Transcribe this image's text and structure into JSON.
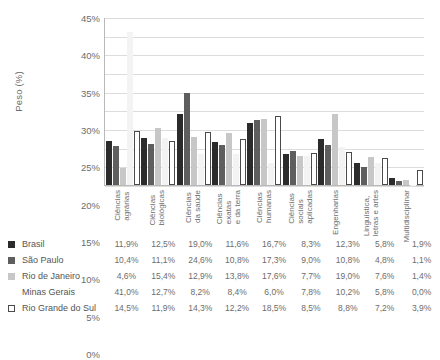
{
  "title_sliver": "",
  "axis": {
    "ylabel": "Peso (%)",
    "yticks": [
      "45%",
      "40%",
      "35%",
      "30%",
      "25%",
      "20%",
      "15%",
      "10%",
      "5%",
      "0%"
    ]
  },
  "colors": {
    "brasil": "#2b2b2b",
    "sao_paulo": "#5e5e5e",
    "rio_de_janeiro": "#c7c7c7",
    "minas_gerais": "#f3f3f3",
    "rio_grande_do_sul": "#ffffff",
    "grid": "#dcdcdc",
    "axis": "#b9b9b9"
  },
  "legend": [
    {
      "label": "Brasil",
      "swatch": "filled-dark-square"
    },
    {
      "label": "São Paulo",
      "swatch": "filled-mid-square"
    },
    {
      "label": "Rio de Janeiro",
      "swatch": "filled-light-square"
    },
    {
      "label": "Minas Gerais",
      "swatch": "no-swatch"
    },
    {
      "label": "Rio Grande do Sul",
      "swatch": "outlined-square"
    }
  ],
  "table": {
    "rows": [
      {
        "name": "Brasil",
        "values": [
          "11,9%",
          "12,5%",
          "19,0%",
          "11,6%",
          "16,7%",
          "8,3%",
          "12,3%",
          "5,8%",
          "1,9%"
        ]
      },
      {
        "name": "São Paulo",
        "values": [
          "10,4%",
          "11,1%",
          "24,6%",
          "10,8%",
          "17,3%",
          "9,0%",
          "10,8%",
          "4,8%",
          "1,1%"
        ]
      },
      {
        "name": "Rio de Janeiro",
        "values": [
          "4,6%",
          "15,4%",
          "12,9%",
          "13,8%",
          "17,6%",
          "7,7%",
          "19,0%",
          "7,6%",
          "1,4%"
        ]
      },
      {
        "name": "Minas Gerais",
        "values": [
          "41,0%",
          "12,7%",
          "8,2%",
          "8,4%",
          "6,0%",
          "7,8%",
          "10,2%",
          "5,8%",
          "0,0%"
        ]
      },
      {
        "name": "Rio Grande do Sul",
        "values": [
          "14,5%",
          "11,9%",
          "14,3%",
          "12,2%",
          "18,5%",
          "8,5%",
          "8,8%",
          "7,2%",
          "3,9%"
        ]
      }
    ]
  },
  "chart_data": {
    "type": "bar",
    "title": "",
    "xlabel": "",
    "ylabel": "Peso (%)",
    "ylim": [
      0,
      45
    ],
    "grid": true,
    "legend_position": "bottom-table",
    "categories": [
      "Ciências\nagrárias",
      "Ciências\nbiológicas",
      "Ciências\nda saúde",
      "Ciências\nexatas\ne da terra",
      "Ciências\nhumanas",
      "Ciências\nsociais\naplicadas",
      "Engenharias",
      "Linguística,\nletras e artes",
      "Multidisciplinar"
    ],
    "series": [
      {
        "name": "Brasil",
        "values": [
          11.9,
          12.5,
          19.0,
          11.6,
          16.7,
          8.3,
          12.3,
          5.8,
          1.9
        ]
      },
      {
        "name": "São Paulo",
        "values": [
          10.4,
          11.1,
          24.6,
          10.8,
          17.3,
          9.0,
          10.8,
          4.8,
          1.1
        ]
      },
      {
        "name": "Rio de Janeiro",
        "values": [
          4.6,
          15.4,
          12.9,
          13.8,
          17.6,
          7.7,
          19.0,
          7.6,
          1.4
        ]
      },
      {
        "name": "Minas Gerais",
        "values": [
          41.0,
          12.7,
          8.2,
          8.4,
          6.0,
          7.8,
          10.2,
          5.8,
          0.0
        ]
      },
      {
        "name": "Rio Grande do Sul",
        "values": [
          14.5,
          11.9,
          14.3,
          12.2,
          18.5,
          8.5,
          8.8,
          7.2,
          3.9
        ]
      }
    ],
    "yticks": [
      45,
      40,
      35,
      30,
      25,
      20,
      15,
      10,
      5,
      0
    ]
  }
}
